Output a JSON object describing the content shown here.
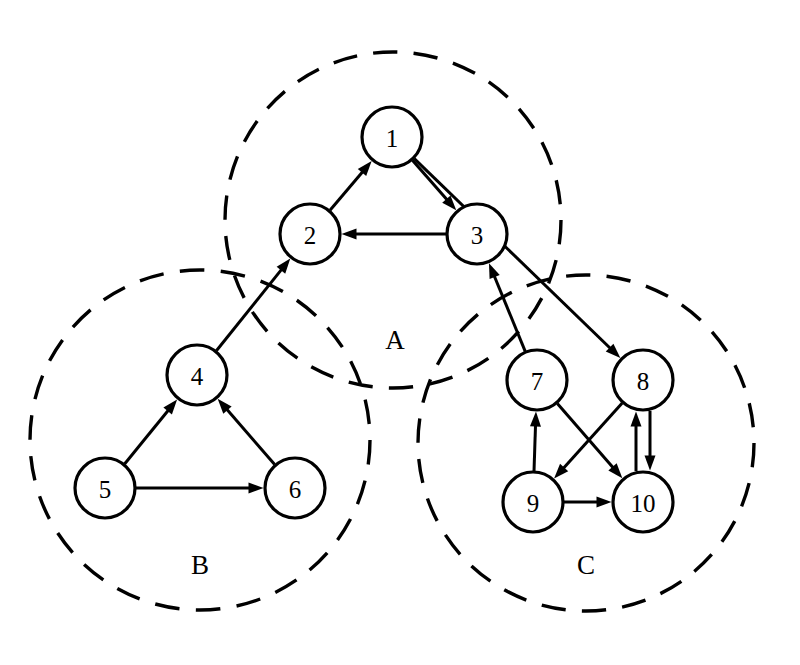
{
  "diagram": {
    "canvas": {
      "width": 800,
      "height": 665
    },
    "background_color": "#ffffff",
    "stroke_color": "#000000",
    "node_fill_color": "#ffffff",
    "node_radius": 30,
    "cluster_stroke_style": "dashed"
  },
  "clusters": [
    {
      "id": "A",
      "label": "A",
      "cx": 393,
      "cy": 220,
      "r": 168,
      "label_x": 395,
      "label_y": 343,
      "members": [
        "1",
        "2",
        "3"
      ]
    },
    {
      "id": "B",
      "label": "B",
      "cx": 200,
      "cy": 440,
      "r": 170,
      "label_x": 200,
      "label_y": 568,
      "members": [
        "4",
        "5",
        "6"
      ]
    },
    {
      "id": "C",
      "label": "C",
      "cx": 586,
      "cy": 443,
      "r": 168,
      "label_x": 586,
      "label_y": 568,
      "members": [
        "7",
        "8",
        "9",
        "10"
      ]
    }
  ],
  "nodes": [
    {
      "id": "1",
      "label": "1",
      "cx": 392,
      "cy": 137,
      "r": 30,
      "cluster": "A"
    },
    {
      "id": "2",
      "label": "2",
      "cx": 310,
      "cy": 234,
      "r": 30,
      "cluster": "A"
    },
    {
      "id": "3",
      "label": "3",
      "cx": 477,
      "cy": 234,
      "r": 30,
      "cluster": "A"
    },
    {
      "id": "4",
      "label": "4",
      "cx": 197,
      "cy": 375,
      "r": 30,
      "cluster": "B"
    },
    {
      "id": "5",
      "label": "5",
      "cx": 105,
      "cy": 488,
      "r": 30,
      "cluster": "B"
    },
    {
      "id": "6",
      "label": "6",
      "cx": 295,
      "cy": 488,
      "r": 30,
      "cluster": "B"
    },
    {
      "id": "7",
      "label": "7",
      "cx": 537,
      "cy": 380,
      "r": 30,
      "cluster": "C"
    },
    {
      "id": "8",
      "label": "8",
      "cx": 643,
      "cy": 380,
      "r": 30,
      "cluster": "C"
    },
    {
      "id": "9",
      "label": "9",
      "cx": 533,
      "cy": 502,
      "r": 30,
      "cluster": "C"
    },
    {
      "id": "10",
      "label": "10",
      "cx": 643,
      "cy": 502,
      "r": 30,
      "cluster": "C"
    }
  ],
  "edges": [
    {
      "from": "2",
      "to": "1",
      "kind": "intra",
      "cluster": "A",
      "offset": 0
    },
    {
      "from": "1",
      "to": "3",
      "kind": "intra",
      "cluster": "A",
      "offset": 0
    },
    {
      "from": "3",
      "to": "2",
      "kind": "intra",
      "cluster": "A",
      "offset": 0
    },
    {
      "from": "5",
      "to": "4",
      "kind": "intra",
      "cluster": "B",
      "offset": 0
    },
    {
      "from": "6",
      "to": "4",
      "kind": "intra",
      "cluster": "B",
      "offset": 0
    },
    {
      "from": "5",
      "to": "6",
      "kind": "intra",
      "cluster": "B",
      "offset": 0
    },
    {
      "from": "9",
      "to": "7",
      "kind": "intra",
      "cluster": "C",
      "offset": 0
    },
    {
      "from": "7",
      "to": "10",
      "kind": "intra",
      "cluster": "C",
      "offset": 0
    },
    {
      "from": "8",
      "to": "9",
      "kind": "intra",
      "cluster": "C",
      "offset": 0
    },
    {
      "from": "9",
      "to": "10",
      "kind": "intra",
      "cluster": "C",
      "offset": 0
    },
    {
      "from": "8",
      "to": "10",
      "kind": "intra",
      "cluster": "C",
      "offset": -7
    },
    {
      "from": "10",
      "to": "8",
      "kind": "intra",
      "cluster": "C",
      "offset": -7
    },
    {
      "from": "4",
      "to": "2",
      "kind": "inter",
      "cluster": "B-A",
      "offset": 0
    },
    {
      "from": "7",
      "to": "3",
      "kind": "inter",
      "cluster": "C-A",
      "offset": 0
    },
    {
      "from": "1",
      "to": "8",
      "kind": "inter",
      "cluster": "A-C",
      "offset": 0
    }
  ],
  "chart_data": {
    "type": "diagram",
    "subtype": "directed-graph-with-clusters",
    "node_count": 10,
    "edge_count": 15,
    "cluster_count": 3,
    "node_ids": [
      "1",
      "2",
      "3",
      "4",
      "5",
      "6",
      "7",
      "8",
      "9",
      "10"
    ],
    "cluster_ids": [
      "A",
      "B",
      "C"
    ],
    "cluster_membership": {
      "A": [
        "1",
        "2",
        "3"
      ],
      "B": [
        "4",
        "5",
        "6"
      ],
      "C": [
        "7",
        "8",
        "9",
        "10"
      ]
    },
    "adjacency": [
      [
        "2",
        "1"
      ],
      [
        "1",
        "3"
      ],
      [
        "3",
        "2"
      ],
      [
        "5",
        "4"
      ],
      [
        "6",
        "4"
      ],
      [
        "5",
        "6"
      ],
      [
        "9",
        "7"
      ],
      [
        "7",
        "10"
      ],
      [
        "8",
        "9"
      ],
      [
        "9",
        "10"
      ],
      [
        "8",
        "10"
      ],
      [
        "10",
        "8"
      ],
      [
        "4",
        "2"
      ],
      [
        "7",
        "3"
      ],
      [
        "1",
        "8"
      ]
    ],
    "inter_cluster_edges": [
      [
        "4",
        "2"
      ],
      [
        "7",
        "3"
      ],
      [
        "1",
        "8"
      ]
    ],
    "directed": true
  }
}
